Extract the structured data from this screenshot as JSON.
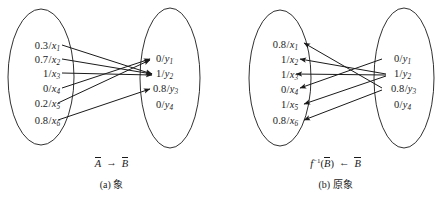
{
  "figure": {
    "background_color": "#ffffff",
    "stroke_color": "#1a1a1a",
    "width": 447,
    "height": 200
  },
  "panels": [
    {
      "id": "a",
      "caption_index": "(a)",
      "caption_text": "象",
      "mapping_label": {
        "source": "A",
        "target": "B",
        "arrow": "→",
        "direction": "left-to-right"
      },
      "left_set": {
        "name": "A-tilde",
        "items": [
          {
            "value": "0.3",
            "element": "x",
            "index": "1",
            "label": "0.3/x₁"
          },
          {
            "value": "0.7",
            "element": "x",
            "index": "2",
            "label": "0.7/x₂"
          },
          {
            "value": "1",
            "element": "x",
            "index": "3",
            "label": "1/x₃"
          },
          {
            "value": "0",
            "element": "x",
            "index": "4",
            "label": "0/x₄"
          },
          {
            "value": "0.2",
            "element": "x",
            "index": "5",
            "label": "0.2/x₅"
          },
          {
            "value": "0.8",
            "element": "x",
            "index": "6",
            "label": "0.8/x₆"
          }
        ]
      },
      "right_set": {
        "name": "B-tilde",
        "items": [
          {
            "value": "0",
            "element": "y",
            "index": "1",
            "label": "0/y₁"
          },
          {
            "value": "1",
            "element": "y",
            "index": "2",
            "label": "1/y₂"
          },
          {
            "value": "0.8",
            "element": "y",
            "index": "3",
            "label": "0.8/y₃"
          },
          {
            "value": "0",
            "element": "y",
            "index": "4",
            "label": "0/y₄"
          }
        ]
      },
      "edges": [
        {
          "from": "x1",
          "to": "y2"
        },
        {
          "from": "x2",
          "to": "y2"
        },
        {
          "from": "x3",
          "to": "y2"
        },
        {
          "from": "x4",
          "to": "y1"
        },
        {
          "from": "x5",
          "to": "y1"
        },
        {
          "from": "x6",
          "to": "y3"
        }
      ]
    },
    {
      "id": "b",
      "caption_index": "(b)",
      "caption_text": "原象",
      "mapping_label": {
        "source": "f⁻¹(B)",
        "target": "B",
        "arrow": "←",
        "direction": "right-to-left"
      },
      "left_set": {
        "name": "f-inverse-B",
        "items": [
          {
            "value": "0.8",
            "element": "x",
            "index": "1",
            "label": "0.8/x₁"
          },
          {
            "value": "1",
            "element": "x",
            "index": "2",
            "label": "1/x₂"
          },
          {
            "value": "1",
            "element": "x",
            "index": "3",
            "label": "1/x₃"
          },
          {
            "value": "0",
            "element": "x",
            "index": "4",
            "label": "0/x₄"
          },
          {
            "value": "1",
            "element": "x",
            "index": "5",
            "label": "1/x₅"
          },
          {
            "value": "0.8",
            "element": "x",
            "index": "6",
            "label": "0.8/x₆"
          }
        ]
      },
      "right_set": {
        "name": "B-tilde",
        "items": [
          {
            "value": "0",
            "element": "y",
            "index": "1",
            "label": "0/y₁"
          },
          {
            "value": "1",
            "element": "y",
            "index": "2",
            "label": "1/y₂"
          },
          {
            "value": "0.8",
            "element": "y",
            "index": "3",
            "label": "0.8/y₃"
          },
          {
            "value": "0",
            "element": "y",
            "index": "4",
            "label": "0/y₄"
          }
        ]
      },
      "edges": [
        {
          "from": "y3",
          "to": "x1"
        },
        {
          "from": "y2",
          "to": "x2"
        },
        {
          "from": "y2",
          "to": "x3"
        },
        {
          "from": "y1",
          "to": "x4"
        },
        {
          "from": "y2",
          "to": "x5"
        },
        {
          "from": "y3",
          "to": "x6"
        }
      ]
    }
  ],
  "glyphs": {
    "slash": "/",
    "arrow_right": "→",
    "arrow_left": "←"
  }
}
